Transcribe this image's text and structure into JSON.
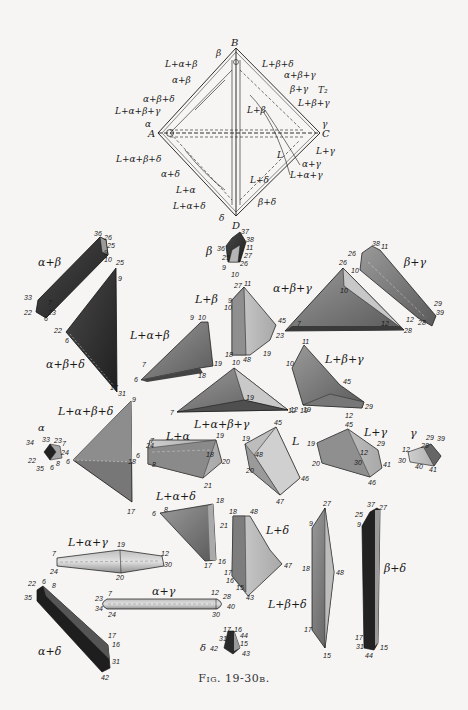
{
  "figure": {
    "caption": "Fig. 19-30b."
  },
  "tetrahedron": {
    "temperature_label": "T₂",
    "vertices": {
      "A": "A",
      "B": "B",
      "C": "C",
      "D": "D"
    },
    "region_labels": [
      "β",
      "L+α+β",
      "α+β",
      "α+β+δ",
      "L+α+β+γ",
      "α",
      "L+α+β+δ",
      "α+δ",
      "L+α",
      "L+α+δ",
      "δ",
      "L+β+δ",
      "α+β+γ",
      "β+γ",
      "L+β",
      "L+β+γ",
      "γ",
      "L+γ",
      "L",
      "α+γ",
      "L+α+γ",
      "L+δ",
      "β+δ"
    ]
  },
  "polyhedra": [
    {
      "id": "alpha-beta",
      "label": "α+β",
      "vertices": [
        "36",
        "26",
        "25",
        "9",
        "10",
        "33",
        "7",
        "23",
        "22",
        "6"
      ]
    },
    {
      "id": "alpha-beta-delta",
      "label": "α+β+δ",
      "vertices": [
        "25",
        "9",
        "22",
        "6",
        "17",
        "31"
      ]
    },
    {
      "id": "beta",
      "label": "β",
      "vertices": [
        "37",
        "38",
        "36",
        "11",
        "25",
        "27",
        "26",
        "9",
        "10"
      ]
    },
    {
      "id": "beta-gamma",
      "label": "β+γ",
      "vertices": [
        "38",
        "11",
        "26",
        "10",
        "29",
        "12",
        "28",
        "39"
      ]
    },
    {
      "id": "alpha-beta-gamma",
      "label": "α+β+γ",
      "vertices": [
        "26",
        "10",
        "7",
        "12",
        "23",
        "28"
      ]
    },
    {
      "id": "L-beta",
      "label": "L+β",
      "vertices": [
        "27",
        "11",
        "9",
        "10",
        "45",
        "18",
        "48",
        "19"
      ]
    },
    {
      "id": "L-alpha-beta",
      "label": "L+α+β",
      "vertices": [
        "9",
        "10",
        "7",
        "19",
        "6",
        "18"
      ]
    },
    {
      "id": "L-alpha-beta-gamma",
      "label": "L+α+β+γ",
      "vertices": [
        "10",
        "19",
        "7",
        "12"
      ]
    },
    {
      "id": "L-beta-gamma",
      "label": "L+β+γ",
      "vertices": [
        "11",
        "10",
        "45",
        "19",
        "12",
        "29"
      ]
    },
    {
      "id": "L-alpha-beta-delta",
      "label": "L+α+β+δ",
      "vertices": [
        "9",
        "6",
        "18",
        "17"
      ]
    },
    {
      "id": "alpha",
      "label": "α",
      "vertices": [
        "34",
        "33",
        "23",
        "7",
        "24",
        "22",
        "8",
        "35",
        "6"
      ]
    },
    {
      "id": "L-alpha",
      "label": "L+α",
      "vertices": [
        "24",
        "7",
        "19",
        "18",
        "6",
        "8",
        "20",
        "21"
      ]
    },
    {
      "id": "L",
      "label": "L",
      "vertices": [
        "45",
        "19",
        "48",
        "20",
        "46",
        "47"
      ]
    },
    {
      "id": "L-gamma",
      "label": "L+γ",
      "vertices": [
        "45",
        "19",
        "29",
        "12",
        "20",
        "30",
        "41",
        "46"
      ]
    },
    {
      "id": "gamma",
      "label": "γ",
      "vertices": [
        "29",
        "39",
        "12",
        "28",
        "30",
        "40",
        "41"
      ]
    },
    {
      "id": "L-alpha-delta",
      "label": "L+α+δ",
      "vertices": [
        "6",
        "8",
        "18",
        "21",
        "17",
        "16"
      ]
    },
    {
      "id": "L-delta",
      "label": "L+δ",
      "vertices": [
        "18",
        "48",
        "47",
        "17",
        "16",
        "15",
        "43"
      ]
    },
    {
      "id": "L-alpha-gamma",
      "label": "L+α+γ",
      "vertices": [
        "7",
        "19",
        "12",
        "24",
        "20",
        "30"
      ]
    },
    {
      "id": "alpha-gamma",
      "label": "α+γ",
      "vertices": [
        "23",
        "7",
        "12",
        "28",
        "34",
        "24",
        "30",
        "40"
      ]
    },
    {
      "id": "L-beta-delta",
      "label": "L+β+δ",
      "vertices": [
        "27",
        "9",
        "18",
        "48",
        "17",
        "15"
      ]
    },
    {
      "id": "beta-delta",
      "label": "β+δ",
      "vertices": [
        "37",
        "27",
        "25",
        "9",
        "17",
        "31",
        "44",
        "15"
      ]
    },
    {
      "id": "alpha-delta",
      "label": "α+δ",
      "vertices": [
        "22",
        "6",
        "8",
        "35",
        "17",
        "16",
        "31",
        "42"
      ]
    },
    {
      "id": "delta",
      "label": "δ",
      "vertices": [
        "17",
        "16",
        "31",
        "44",
        "42",
        "15",
        "43"
      ]
    }
  ],
  "colors": {
    "background": "#f6f5f3",
    "dark": "#2a2a2a",
    "medium": "#6f6f6f",
    "light": "#b4b4b4",
    "lighter": "#d2d2d2",
    "line": "#1a1a1a"
  }
}
